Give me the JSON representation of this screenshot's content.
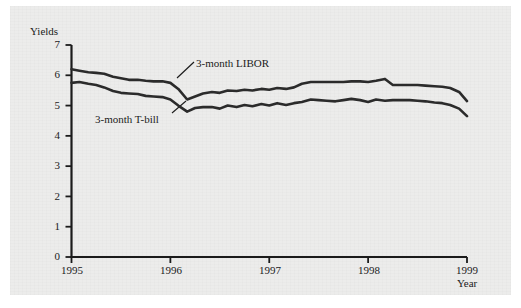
{
  "chart_data": {
    "type": "line",
    "title": "",
    "xlabel": "Year",
    "ylabel": "Yields",
    "ylim": [
      0,
      7
    ],
    "xlim": [
      1995,
      1999
    ],
    "grid": false,
    "legend_position": "inline-annotations",
    "ytick_labels": [
      "0",
      "1",
      "2",
      "3",
      "4",
      "5",
      "6",
      "7"
    ],
    "ytick_values": [
      0,
      1,
      2,
      3,
      4,
      5,
      6,
      7
    ],
    "xtick_labels": [
      "1995",
      "1996",
      "1997",
      "1998",
      "1999"
    ],
    "xtick_values": [
      1995,
      1996,
      1997,
      1998,
      1999
    ],
    "line_color": "#2b2b2b",
    "series": [
      {
        "name": "3-month LIBOR",
        "annotation": "3-month LIBOR",
        "x": [
          1995.0,
          1995.08,
          1995.17,
          1995.25,
          1995.33,
          1995.42,
          1995.5,
          1995.58,
          1995.67,
          1995.75,
          1995.83,
          1995.92,
          1996.0,
          1996.08,
          1996.17,
          1996.25,
          1996.33,
          1996.42,
          1996.5,
          1996.58,
          1996.67,
          1996.75,
          1996.83,
          1996.92,
          1997.0,
          1997.08,
          1997.17,
          1997.25,
          1997.33,
          1997.42,
          1997.5,
          1997.58,
          1997.67,
          1997.75,
          1997.83,
          1997.92,
          1998.0,
          1998.08,
          1998.17,
          1998.25,
          1998.33,
          1998.42,
          1998.5,
          1998.58,
          1998.67,
          1998.75,
          1998.83,
          1998.92,
          1999.0
        ],
        "values": [
          6.2,
          6.15,
          6.1,
          6.08,
          6.05,
          5.95,
          5.9,
          5.85,
          5.85,
          5.82,
          5.8,
          5.8,
          5.75,
          5.55,
          5.2,
          5.3,
          5.4,
          5.45,
          5.42,
          5.5,
          5.48,
          5.52,
          5.5,
          5.55,
          5.52,
          5.58,
          5.55,
          5.6,
          5.72,
          5.78,
          5.78,
          5.78,
          5.78,
          5.78,
          5.8,
          5.8,
          5.78,
          5.82,
          5.88,
          5.68,
          5.68,
          5.68,
          5.68,
          5.66,
          5.64,
          5.62,
          5.58,
          5.45,
          5.15
        ]
      },
      {
        "name": "3-month T-bill",
        "annotation": "3-month T-bill",
        "x": [
          1995.0,
          1995.08,
          1995.17,
          1995.25,
          1995.33,
          1995.42,
          1995.5,
          1995.58,
          1995.67,
          1995.75,
          1995.83,
          1995.92,
          1996.0,
          1996.08,
          1996.17,
          1996.25,
          1996.33,
          1996.42,
          1996.5,
          1996.58,
          1996.67,
          1996.75,
          1996.83,
          1996.92,
          1997.0,
          1997.08,
          1997.17,
          1997.25,
          1997.33,
          1997.42,
          1997.5,
          1997.58,
          1997.67,
          1997.75,
          1997.83,
          1997.92,
          1998.0,
          1998.08,
          1998.17,
          1998.25,
          1998.33,
          1998.42,
          1998.5,
          1998.58,
          1998.67,
          1998.75,
          1998.83,
          1998.92,
          1999.0
        ],
        "values": [
          5.75,
          5.78,
          5.72,
          5.68,
          5.6,
          5.48,
          5.42,
          5.4,
          5.38,
          5.32,
          5.3,
          5.28,
          5.2,
          5.0,
          4.8,
          4.92,
          4.95,
          4.95,
          4.9,
          5.0,
          4.95,
          5.02,
          4.98,
          5.05,
          5.0,
          5.08,
          5.02,
          5.08,
          5.12,
          5.2,
          5.18,
          5.16,
          5.14,
          5.18,
          5.22,
          5.18,
          5.12,
          5.2,
          5.16,
          5.18,
          5.18,
          5.18,
          5.16,
          5.14,
          5.1,
          5.08,
          5.02,
          4.9,
          4.65
        ]
      }
    ]
  },
  "axes": {
    "y_title": "Yields",
    "x_title": "Year"
  },
  "annotations": {
    "libor_label": "3-month LIBOR",
    "tbill_label": "3-month T-bill"
  }
}
